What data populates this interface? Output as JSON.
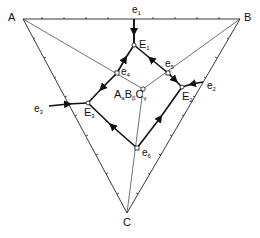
{
  "diagram": {
    "type": "ternary phase diagram (liquidus projection)",
    "vertices": [
      {
        "id": "A",
        "label": "A",
        "x": 23,
        "y": 19
      },
      {
        "id": "B",
        "label": "B",
        "x": 240,
        "y": 19
      },
      {
        "id": "C",
        "label": "C",
        "x": 127,
        "y": 213
      }
    ],
    "compound": {
      "label": "A",
      "sub1": "a",
      "label2": "B",
      "sub2": "β",
      "label3": "C",
      "sub3": "γ",
      "x": 143,
      "y": 89
    },
    "binary_eutectics": [
      {
        "label": "e",
        "sub": "1",
        "x": 134,
        "y": 19
      },
      {
        "label": "e",
        "sub": "2",
        "x": 203,
        "y": 82
      },
      {
        "label": "e",
        "sub": "3",
        "x": 49,
        "y": 106
      }
    ],
    "saddle_points": [
      {
        "label": "e",
        "sub": "4",
        "x": 117,
        "y": 73
      },
      {
        "label": "e",
        "sub": "5",
        "x": 168,
        "y": 73
      },
      {
        "label": "e",
        "sub": "6",
        "x": 137,
        "y": 148
      }
    ],
    "ternary_eutectics": [
      {
        "label": "E",
        "sub": "1",
        "x": 134,
        "y": 45
      },
      {
        "label": "E",
        "sub": "2",
        "x": 182,
        "y": 87
      },
      {
        "label": "E",
        "sub": "3",
        "x": 88,
        "y": 103
      }
    ]
  }
}
